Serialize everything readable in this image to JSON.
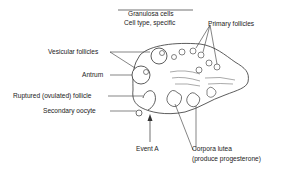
{
  "diagram": {
    "labels": {
      "granulosa": "Granulosa cells",
      "cell_type": "Cell type, specific",
      "primary": "Primary follicles",
      "vesicular": "Vesicular follicles",
      "antrum": "Antrum",
      "ruptured": "Ruptured (ovulated) follicle",
      "oocyte": "Secondary oocyte",
      "event": "Event A",
      "corpora1": "Corpora lutea",
      "corpora2": "(produce progesterone)"
    },
    "colors": {
      "line": "#333333",
      "background": "#ffffff"
    }
  }
}
